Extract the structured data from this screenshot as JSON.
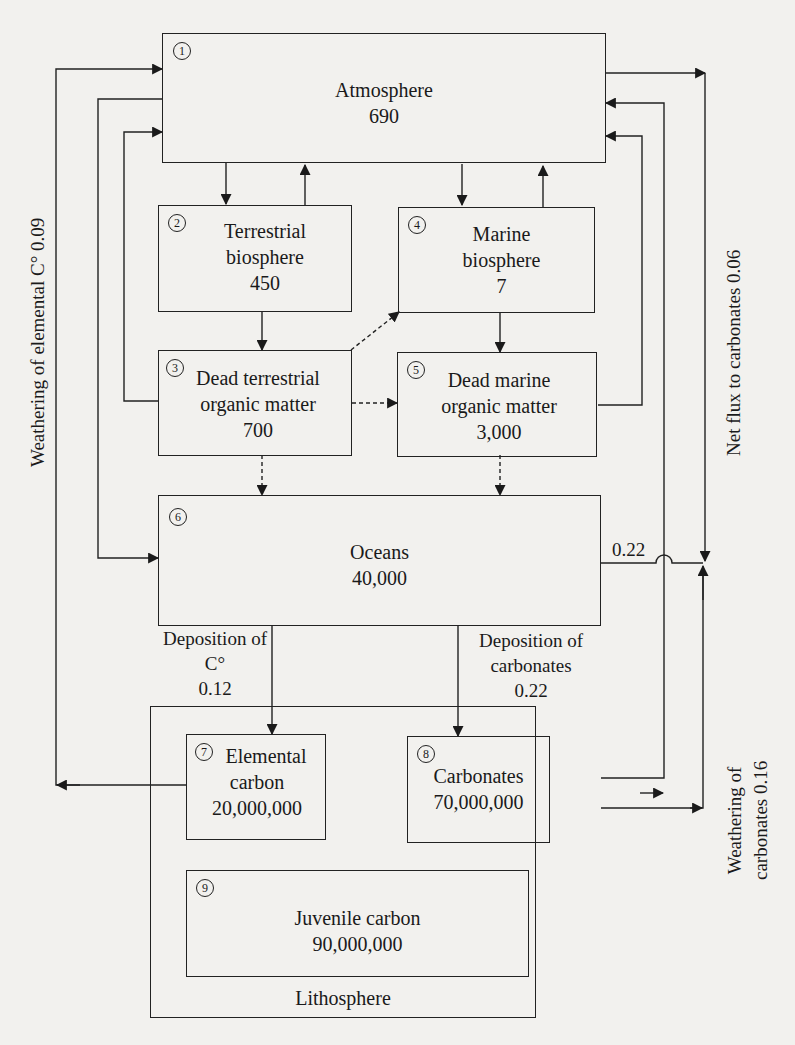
{
  "diagram": {
    "boxes": [
      {
        "id": 1,
        "number": "1",
        "name": "Atmosphere",
        "line1": "Atmosphere",
        "line2": "",
        "value": "690"
      },
      {
        "id": 2,
        "number": "2",
        "name": "Terrestrial biosphere",
        "line1": "Terrestrial",
        "line2": "biosphere",
        "value": "450"
      },
      {
        "id": 3,
        "number": "3",
        "name": "Dead terrestrial organic matter",
        "line1": "Dead terrestrial",
        "line2": "organic matter",
        "value": "700"
      },
      {
        "id": 4,
        "number": "4",
        "name": "Marine biosphere",
        "line1": "Marine",
        "line2": "biosphere",
        "value": "7"
      },
      {
        "id": 5,
        "number": "5",
        "name": "Dead marine organic matter",
        "line1": "Dead marine",
        "line2": "organic matter",
        "value": "3,000"
      },
      {
        "id": 6,
        "number": "6",
        "name": "Oceans",
        "line1": "Oceans",
        "line2": "",
        "value": "40,000"
      },
      {
        "id": 7,
        "number": "7",
        "name": "Elemental carbon",
        "line1": "Elemental",
        "line2": "carbon",
        "value": "20,000,000"
      },
      {
        "id": 8,
        "number": "8",
        "name": "Carbonates",
        "line1": "Carbonates",
        "line2": "",
        "value": "70,000,000"
      },
      {
        "id": 9,
        "number": "9",
        "name": "Juvenile carbon",
        "line1": "Juvenile carbon",
        "line2": "",
        "value": "90,000,000"
      }
    ],
    "container": {
      "label": "Lithosphere"
    },
    "flux_labels": {
      "deposition_c": {
        "line1": "Deposition of",
        "line2": "C°",
        "value": "0.12"
      },
      "deposition_carbonates": {
        "line1": "Deposition of",
        "line2": "carbonates",
        "value": "0.22"
      },
      "oceans_out": "0.22",
      "weathering_elemental": "Weathering of elemental C° 0.09",
      "net_flux_carbonates": "Net flux to carbonates 0.06",
      "weathering_carbonates": {
        "line1": "Weathering of",
        "line2": "carbonates 0.16"
      }
    },
    "edges": [
      {
        "from": 1,
        "to": 2,
        "style": "solid"
      },
      {
        "from": 2,
        "to": 1,
        "style": "solid"
      },
      {
        "from": 1,
        "to": 4,
        "style": "solid"
      },
      {
        "from": 4,
        "to": 1,
        "style": "solid"
      },
      {
        "from": 2,
        "to": 3,
        "style": "solid"
      },
      {
        "from": 4,
        "to": 5,
        "style": "solid"
      },
      {
        "from": 3,
        "to": 1,
        "style": "solid"
      },
      {
        "from": 5,
        "to": 1,
        "style": "solid"
      },
      {
        "from": 3,
        "to": 4,
        "style": "dashed"
      },
      {
        "from": 3,
        "to": 5,
        "style": "dashed"
      },
      {
        "from": 3,
        "to": 6,
        "style": "dashed"
      },
      {
        "from": 5,
        "to": 6,
        "style": "dashed"
      },
      {
        "from": 1,
        "to": 6,
        "style": "solid"
      },
      {
        "from": 7,
        "to": 1,
        "style": "solid",
        "label": "Weathering of elemental C° 0.09"
      },
      {
        "from": 6,
        "to": 7,
        "style": "solid",
        "label": "Deposition of C° 0.12"
      },
      {
        "from": 6,
        "to": 8,
        "style": "solid",
        "label": "Deposition of carbonates 0.22"
      },
      {
        "from": 8,
        "to": 1,
        "style": "solid",
        "label": "Weathering of carbonates 0.16"
      },
      {
        "from": 1,
        "to": "net",
        "style": "solid",
        "label": "Net flux to carbonates 0.06"
      },
      {
        "from": 6,
        "to": "net",
        "style": "solid",
        "label": "0.22"
      }
    ]
  },
  "colors": {
    "ink": "#222222",
    "paper": "#f2f1ee"
  }
}
